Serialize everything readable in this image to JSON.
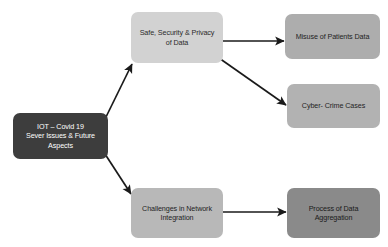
{
  "diagram": {
    "background_color": "#ffffff",
    "edge_color": "#1a1a1a",
    "nodes": [
      {
        "id": "root",
        "label": "IOT – Covid 19\nSever Issues & Future\nAspects",
        "fill": "#3d3d3d",
        "text_color": "#ffffff"
      },
      {
        "id": "safety",
        "label": "Safe, Security & Privacy\nof Data",
        "fill": "#d2d2d2",
        "text_color": "#2b2b2b"
      },
      {
        "id": "misuse",
        "label": "Misuse of Patients Data",
        "fill": "#adadad",
        "text_color": "#1f1f1f"
      },
      {
        "id": "cyber",
        "label": "Cyber- Crime Cases",
        "fill": "#b2b2b2",
        "text_color": "#1f1f1f"
      },
      {
        "id": "challenges",
        "label": "Challenges in Network\nIntegration",
        "fill": "#b8b8b8",
        "text_color": "#1f1f1f"
      },
      {
        "id": "aggregation",
        "label": "Process of Data\nAggregation",
        "fill": "#8a8a8a",
        "text_color": "#1a1a1a"
      }
    ],
    "edges": [
      {
        "id": "root-to-safety",
        "from": "root",
        "to": "safety",
        "style": "arrow-diagonal-up"
      },
      {
        "id": "root-to-challenges",
        "from": "root",
        "to": "challenges",
        "style": "arrow-diagonal-down"
      },
      {
        "id": "safety-to-misuse",
        "from": "safety",
        "to": "misuse",
        "style": "arrow-horizontal"
      },
      {
        "id": "safety-to-cyber",
        "from": "safety",
        "to": "cyber",
        "style": "arrow-diagonal-down"
      },
      {
        "id": "challenges-to-aggregation",
        "from": "challenges",
        "to": "aggregation",
        "style": "arrow-horizontal"
      }
    ]
  }
}
